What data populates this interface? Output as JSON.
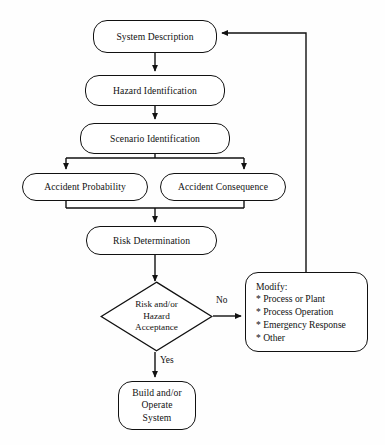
{
  "diagram": {
    "type": "flowchart",
    "nodes": {
      "system_description": {
        "label": "System Description",
        "shape": "rounded-rectangle"
      },
      "hazard_identification": {
        "label": "Hazard Identification",
        "shape": "rounded-rectangle"
      },
      "scenario_identification": {
        "label": "Scenario Identification",
        "shape": "rounded-rectangle"
      },
      "accident_probability": {
        "label": "Accident Probability",
        "shape": "rounded-rectangle"
      },
      "accident_consequence": {
        "label": "Accident Consequence",
        "shape": "rounded-rectangle"
      },
      "risk_determination": {
        "label": "Risk Determination",
        "shape": "rounded-rectangle"
      },
      "decision": {
        "label": "Risk and/or\nHazard\nAcceptance",
        "shape": "diamond"
      },
      "build_operate": {
        "label": "Build and/or\nOperate\nSystem",
        "shape": "rounded-rectangle"
      },
      "modify": {
        "title": "Modify:",
        "shape": "rounded-rectangle",
        "items": [
          "* Process or Plant",
          "* Process Operation",
          "* Emergency Response",
          "* Other"
        ]
      }
    },
    "edge_labels": {
      "no": "No",
      "yes": "Yes"
    },
    "colors": {
      "stroke": "#111111",
      "fill": "#ffffff",
      "background": "#fefefe",
      "text": "#111111"
    }
  }
}
